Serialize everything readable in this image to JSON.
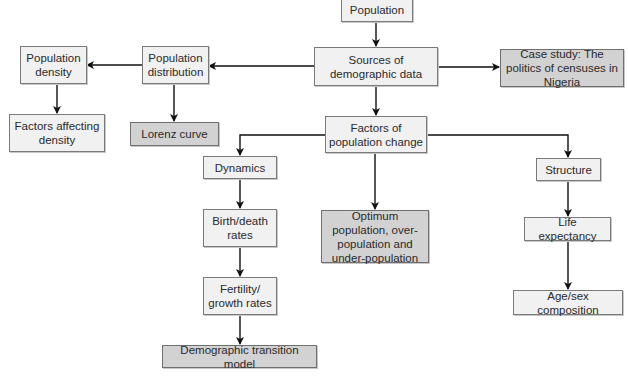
{
  "diagram": {
    "title": "Population",
    "colors": {
      "box_fill": "#f1f1f1",
      "shaded_fill": "#d2d2d2",
      "border": "#7a7a7a",
      "line": "#111111",
      "text": "#2a2a2a"
    },
    "nodes": {
      "population": {
        "label": "Population",
        "shaded": false
      },
      "sources": {
        "label": "Sources of demographic data",
        "shaded": false
      },
      "case_study": {
        "label": "Case study: The politics of censuses in Nigeria",
        "shaded": true
      },
      "distribution": {
        "label": "Population distribution",
        "shaded": false
      },
      "density": {
        "label": "Population density",
        "shaded": false
      },
      "factors_density": {
        "label": "Factors affecting density",
        "shaded": false
      },
      "lorenz": {
        "label": "Lorenz curve",
        "shaded": true
      },
      "factors_change": {
        "label": "Factors of population change",
        "shaded": false
      },
      "dynamics": {
        "label": "Dynamics",
        "shaded": false
      },
      "birth_death": {
        "label": "Birth/death rates",
        "shaded": false
      },
      "fertility": {
        "label": "Fertility/ growth rates",
        "shaded": false
      },
      "dtm": {
        "label": "Demographic transition model",
        "shaded": true
      },
      "optimum": {
        "label": "Optimum population, over-population and under-population",
        "shaded": true
      },
      "structure": {
        "label": "Structure",
        "shaded": false
      },
      "life_expectancy": {
        "label": "Life expectancy",
        "shaded": false
      },
      "age_sex": {
        "label": "Age/sex composition",
        "shaded": false
      }
    },
    "edges": [
      {
        "from": "Population",
        "to": "Sources of demographic data"
      },
      {
        "from": "Sources of demographic data",
        "to": "Case study: The politics of censuses in Nigeria"
      },
      {
        "from": "Sources of demographic data",
        "to": "Population distribution"
      },
      {
        "from": "Population distribution",
        "to": "Population density"
      },
      {
        "from": "Population density",
        "to": "Factors affecting density"
      },
      {
        "from": "Population distribution",
        "to": "Lorenz curve"
      },
      {
        "from": "Sources of demographic data",
        "to": "Factors of population change"
      },
      {
        "from": "Factors of population change",
        "to": "Dynamics"
      },
      {
        "from": "Factors of population change",
        "to": "Optimum population, over-population and under-population"
      },
      {
        "from": "Factors of population change",
        "to": "Structure"
      },
      {
        "from": "Dynamics",
        "to": "Birth/death rates"
      },
      {
        "from": "Birth/death rates",
        "to": "Fertility/ growth rates"
      },
      {
        "from": "Fertility/ growth rates",
        "to": "Demographic transition model"
      },
      {
        "from": "Structure",
        "to": "Life expectancy"
      },
      {
        "from": "Life expectancy",
        "to": "Age/sex composition"
      }
    ]
  }
}
